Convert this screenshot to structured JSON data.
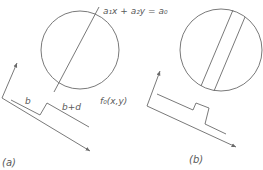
{
  "figure": {
    "panels": [
      {
        "id": "a",
        "caption": "(a)",
        "labels": {
          "line_equation": "a₁x + a₂y = a₀",
          "function": "f₀(x,y)",
          "step_low": "b",
          "step_high": "b+d"
        }
      },
      {
        "id": "b",
        "caption": "(b)"
      }
    ],
    "colors": {
      "stroke": "#6a6a6a",
      "text": "#5a5a5a",
      "background": "#ffffff"
    }
  }
}
